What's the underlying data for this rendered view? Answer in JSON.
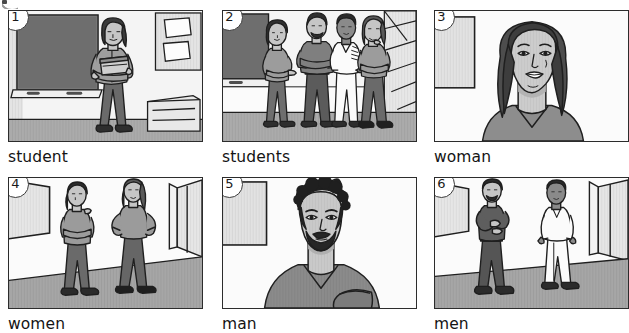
{
  "page": {
    "background_color": "#ffffff",
    "layout": "2 rows x 3 columns of numbered illustration panels with captions",
    "ink_color": "#1a1a1a"
  },
  "palette": {
    "outline": "#1f1f1f",
    "wall_light": "#f2f2f2",
    "wall_shade": "#d9d9d9",
    "floor": "#a8a8a8",
    "skin": "#c9c9c9",
    "skin_dark": "#8f8f8f",
    "hair_dark": "#2b2b2b",
    "hair_mid": "#575757",
    "clothes_mid": "#8d8d8d",
    "clothes_dark": "#5c5c5c",
    "clothes_light": "#fbfbfb",
    "chalkboard": "#6e6e6e",
    "badge_bg": "#ffffff",
    "badge_border": "#3a3a3a"
  },
  "panels": [
    {
      "number": "1",
      "caption": "student",
      "scene": "A female student standing in a classroom holding books, in front of a chalkboard, with papers pinned on the wall and a cabinet",
      "figure_count": 1
    },
    {
      "number": "2",
      "caption": "students",
      "scene": "Four students standing and talking together in a classroom beside a chalkboard and a staircase",
      "figure_count": 4
    },
    {
      "number": "3",
      "caption": "woman",
      "scene": "Close-up portrait of a woman with long dark hair speaking",
      "figure_count": 1
    },
    {
      "number": "4",
      "caption": "women",
      "scene": "Two women standing and talking in a hallway",
      "figure_count": 2
    },
    {
      "number": "5",
      "caption": "man",
      "scene": "Close-up portrait of a man with curly hair and a beard, arms crossed",
      "figure_count": 1
    },
    {
      "number": "6",
      "caption": "men",
      "scene": "Two men standing and talking in a hallway",
      "figure_count": 2
    }
  ]
}
